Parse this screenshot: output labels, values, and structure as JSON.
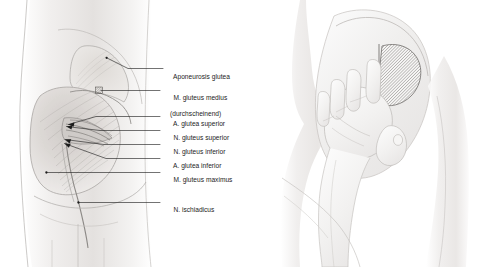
{
  "plate": {
    "width": 486,
    "height": 267,
    "background": "#ffffff",
    "ink": "#1c1c1c",
    "flesh_light": "#f3f2f1",
    "flesh_mid": "#dedcda",
    "flesh_dark": "#b9b6b3"
  },
  "left_figure": {
    "name": "gluteal-region-dissection",
    "caption_side": "right",
    "labels": [
      {
        "id": "aponeurosis-glutea",
        "text": "Aponeurosis glutea",
        "sub": "",
        "text_x": 166,
        "text_y": 71,
        "leader": {
          "x1": 155,
          "y1": 68.5,
          "x2": 120,
          "y2": 56,
          "x3": 107,
          "y3": 70
        },
        "marker": "dot"
      },
      {
        "id": "m-gluteus-medius",
        "text": "M. gluteus medius",
        "sub": "(durchscheinend)",
        "text_x": 166,
        "text_y": 88,
        "leader": {
          "x1": 160,
          "y1": 90.5,
          "x2": 108,
          "y2": 90.5,
          "x3": 100,
          "y3": 90.5
        },
        "marker": "hatch-patch"
      },
      {
        "id": "a-glutea-superior",
        "text": "A. glutea superior",
        "sub": "",
        "text_x": 166,
        "text_y": 114,
        "leader": {
          "x1": 160,
          "y1": 116.5,
          "x2": 95,
          "y2": 116.5,
          "x3": 68,
          "y3": 124
        },
        "marker": "arrow"
      },
      {
        "id": "n-gluteus-superior",
        "text": "N. gluteus superior",
        "sub": "",
        "text_x": 166,
        "text_y": 128,
        "leader": {
          "x1": 160,
          "y1": 130.5,
          "x2": 100,
          "y2": 130.5,
          "x3": 66,
          "y3": 126
        },
        "marker": "arrow"
      },
      {
        "id": "n-gluteus-inferior",
        "text": "N. gluteus inferior",
        "sub": "",
        "text_x": 166,
        "text_y": 142,
        "leader": {
          "x1": 160,
          "y1": 144.5,
          "x2": 104,
          "y2": 144.5,
          "x3": 64,
          "y3": 140
        },
        "marker": "arrow"
      },
      {
        "id": "a-glutea-inferior",
        "text": "A. glutea inferior",
        "sub": "",
        "text_x": 166,
        "text_y": 156,
        "leader": {
          "x1": 160,
          "y1": 158.5,
          "x2": 106,
          "y2": 158.5,
          "x3": 64,
          "y3": 144
        },
        "marker": "arrow"
      },
      {
        "id": "m-gluteus-maximus",
        "text": "M. gluteus maximus",
        "sub": "",
        "text_x": 166,
        "text_y": 170,
        "leader": {
          "x1": 160,
          "y1": 172.5,
          "x2": 60,
          "y2": 172.5,
          "x3": 46,
          "y3": 172.5
        },
        "marker": "dot"
      },
      {
        "id": "n-ischiadicus",
        "text": "N. ischiadicus",
        "sub": "",
        "text_x": 166,
        "text_y": 200,
        "leader": {
          "x1": 160,
          "y1": 202.5,
          "x2": 86,
          "y2": 202.5,
          "x3": 78,
          "y3": 202.5
        },
        "marker": "dot"
      }
    ]
  },
  "right_figure": {
    "name": "injection-site-hand-landmark",
    "description": "hand placed on hip marking the safe intramuscular injection quadrant",
    "hatched_zone": {
      "id": "injection-quadrant",
      "hatch_angle_deg": 45,
      "hatch_spacing_px": 2.2
    },
    "labels": []
  }
}
